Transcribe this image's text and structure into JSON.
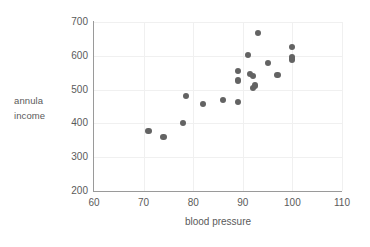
{
  "chart_data": {
    "type": "scatter",
    "title": "",
    "xlabel": "blood pressure",
    "ylabel": "annula income",
    "ylabel_lines": [
      "annula",
      "income"
    ],
    "xlim": [
      60,
      110
    ],
    "ylim": [
      200,
      700
    ],
    "x_ticks": [
      60,
      70,
      80,
      90,
      100,
      110
    ],
    "y_ticks": [
      200,
      300,
      400,
      500,
      600,
      700
    ],
    "grid": true,
    "legend": "none",
    "marker_color": "#636363",
    "axis_color": "#9a9a9a",
    "grid_color": "#f0f0f0",
    "text_color": "#5a5a5a",
    "points": [
      {
        "x": 71,
        "y": 378
      },
      {
        "x": 74,
        "y": 360
      },
      {
        "x": 78,
        "y": 402
      },
      {
        "x": 78.5,
        "y": 480
      },
      {
        "x": 82,
        "y": 458
      },
      {
        "x": 86,
        "y": 470
      },
      {
        "x": 89,
        "y": 463
      },
      {
        "x": 89,
        "y": 527
      },
      {
        "x": 89,
        "y": 555
      },
      {
        "x": 91,
        "y": 603
      },
      {
        "x": 91.5,
        "y": 547
      },
      {
        "x": 92,
        "y": 541
      },
      {
        "x": 92,
        "y": 505
      },
      {
        "x": 92.5,
        "y": 512
      },
      {
        "x": 93,
        "y": 668
      },
      {
        "x": 95,
        "y": 578
      },
      {
        "x": 97,
        "y": 543
      },
      {
        "x": 100,
        "y": 627
      },
      {
        "x": 100,
        "y": 597
      },
      {
        "x": 100,
        "y": 589
      }
    ]
  }
}
